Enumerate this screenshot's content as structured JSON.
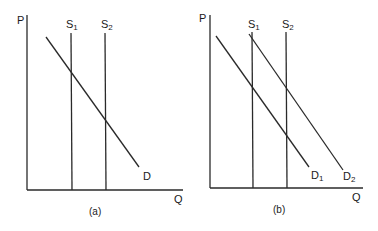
{
  "figure": {
    "panels": [
      {
        "id": "a",
        "caption": "(a)",
        "axes": {
          "y_label": "P",
          "x_label": "Q"
        },
        "supply_curves": [
          {
            "name": "S",
            "subscript": "1"
          },
          {
            "name": "S",
            "subscript": "2"
          }
        ],
        "demand_curves": [
          {
            "name": "D",
            "subscript": ""
          }
        ]
      },
      {
        "id": "b",
        "caption": "(b)",
        "axes": {
          "y_label": "P",
          "x_label": "Q"
        },
        "supply_curves": [
          {
            "name": "S",
            "subscript": "1"
          },
          {
            "name": "S",
            "subscript": "2"
          }
        ],
        "demand_curves": [
          {
            "name": "D",
            "subscript": "1"
          },
          {
            "name": "D",
            "subscript": "2"
          }
        ]
      }
    ],
    "colors": {
      "line": "#2a2a2a",
      "background": "#ffffff"
    }
  }
}
